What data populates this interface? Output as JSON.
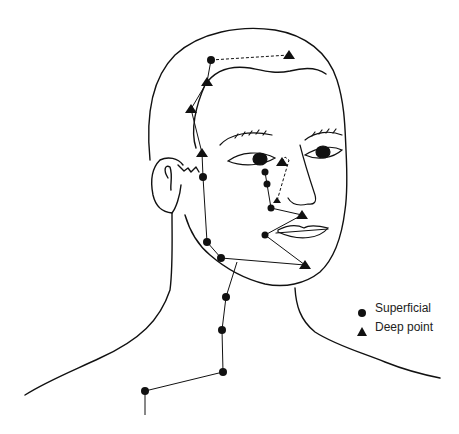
{
  "legend": {
    "items": [
      {
        "symbol": "circle",
        "label": "Superficial"
      },
      {
        "symbol": "triangle",
        "label": "Deep point"
      }
    ]
  },
  "colors": {
    "ink": "#111111",
    "background": "#ffffff"
  },
  "points": {
    "superficial": [
      [
        211,
        60
      ],
      [
        203,
        177
      ],
      [
        207,
        242
      ],
      [
        221,
        258
      ],
      [
        265,
        172
      ],
      [
        267,
        184
      ],
      [
        271,
        208
      ],
      [
        265,
        235
      ],
      [
        226,
        297
      ],
      [
        222,
        330
      ],
      [
        223,
        372
      ],
      [
        145,
        391
      ]
    ],
    "deep": [
      [
        289,
        55
      ],
      [
        207,
        82
      ],
      [
        191,
        109
      ],
      [
        202,
        153
      ],
      [
        282,
        162
      ],
      [
        277,
        201
      ],
      [
        302,
        215
      ],
      [
        305,
        265
      ]
    ]
  }
}
